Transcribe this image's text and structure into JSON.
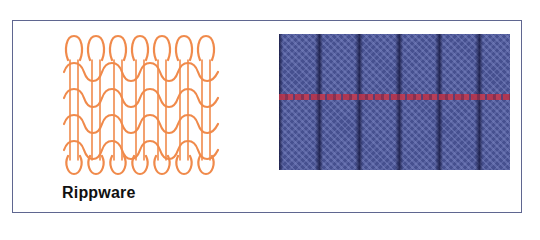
{
  "figure": {
    "label": "Rippware",
    "diagram": {
      "description": "rib knit stitch loop diagram",
      "columns": 7,
      "rows": 4,
      "stroke_color": "#f08a4b"
    },
    "photo": {
      "description": "blue rib knit fabric sample with red marker yarn",
      "base_color": "#46508f",
      "marker_color": "#b8334a"
    },
    "frame_color": "#5f6690"
  }
}
